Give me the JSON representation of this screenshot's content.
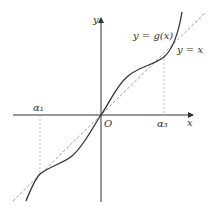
{
  "diagram": {
    "title": "",
    "axes": {
      "x_label": "x",
      "y_label": "y",
      "origin_label": "O"
    },
    "labels": {
      "curve": "y = g(x)",
      "line": "y = x",
      "alpha1": "α₁",
      "alpha3": "α₃"
    },
    "colors": {
      "curve": "#333333",
      "axes": "#333333",
      "dashed": "#888888"
    }
  }
}
